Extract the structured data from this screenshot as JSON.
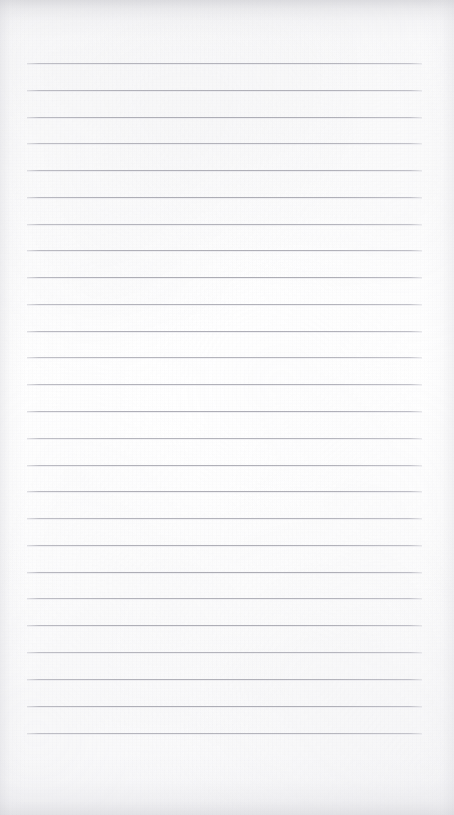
{
  "document": {
    "kind": "scanned-blank-lined-notepad-page",
    "title": "Blank Lined Paper",
    "visible_text": "",
    "handwriting": "none",
    "page_width_px": 454,
    "page_height_px": 815,
    "paper_color": "#fdfdfd",
    "background_color": "#ffffff"
  },
  "ruling": {
    "line_color": "#a9a9b2",
    "line_thickness_px": 1,
    "line_count": 26,
    "line_left_px": 27,
    "line_right_px": 422,
    "line_width_px": 395,
    "first_line_y_px": 63,
    "last_line_y_px": 733,
    "line_spacing_px": 26.8,
    "margin_rule": "none",
    "header_rule": "none",
    "line_y_positions": [
      63,
      90,
      117,
      143,
      170,
      197,
      224,
      250,
      277,
      304,
      331,
      357,
      384,
      411,
      438,
      465,
      491,
      518,
      545,
      572,
      598,
      625,
      652,
      679,
      706,
      733
    ]
  },
  "scan_artifacts": {
    "top_edge_shadow": "#c4c4ca",
    "bottom_edge_shadow": "#cbcbd1",
    "left_edge_shadow": "#d1d1d7",
    "right_edge_shadow": "#d3d3d9",
    "grain_tint": "#c8c8ce",
    "has_paper_texture": true
  }
}
